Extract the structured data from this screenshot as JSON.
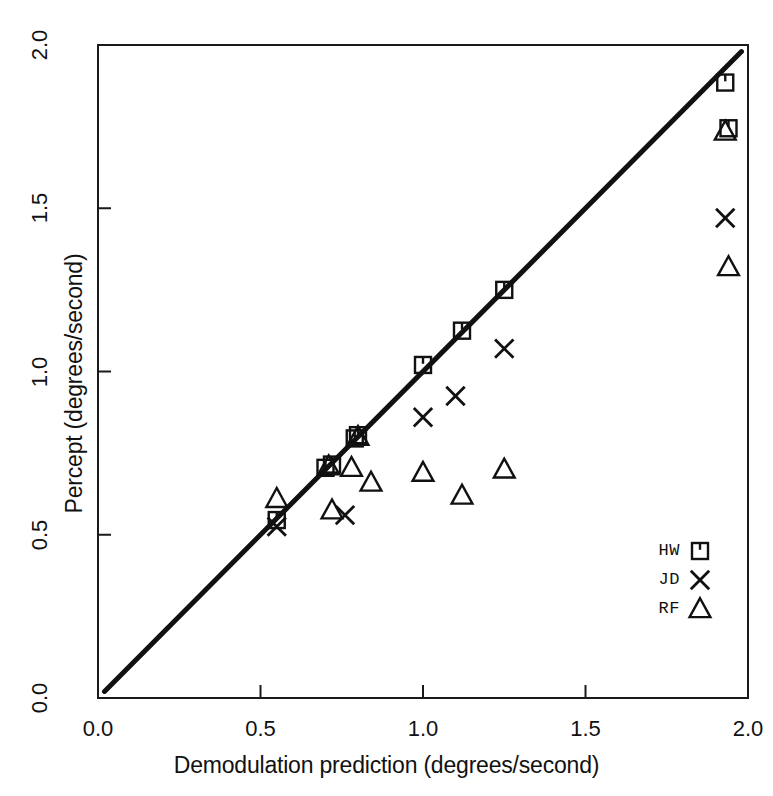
{
  "chart_data": {
    "type": "scatter",
    "title": "",
    "xlabel": "Demodulation prediction (degrees/second)",
    "ylabel": "Percept (degrees/second)",
    "xlim": [
      0.0,
      2.0
    ],
    "ylim": [
      0.0,
      2.0
    ],
    "xticks": [
      "0.0",
      "0.5",
      "1.0",
      "1.5",
      "2.0"
    ],
    "yticks": [
      "0.0",
      "0.5",
      "1.0",
      "1.5",
      "2.0"
    ],
    "xtick_values": [
      0.0,
      0.5,
      1.0,
      1.5,
      2.0
    ],
    "ytick_values": [
      0.0,
      0.5,
      1.0,
      1.5,
      2.0
    ],
    "grid": false,
    "legend_position": "bottom-right",
    "reference_line": {
      "name": "identity-line",
      "from": [
        0.02,
        0.02
      ],
      "to": [
        1.98,
        1.98
      ]
    },
    "series": [
      {
        "name": "HW",
        "marker": "square",
        "points": [
          [
            0.55,
            0.545
          ],
          [
            0.7,
            0.705
          ],
          [
            0.72,
            0.715
          ],
          [
            0.79,
            0.795
          ],
          [
            0.8,
            0.805
          ],
          [
            1.0,
            1.02
          ],
          [
            1.12,
            1.125
          ],
          [
            1.25,
            1.25
          ],
          [
            1.93,
            1.885
          ],
          [
            1.94,
            1.745
          ]
        ]
      },
      {
        "name": "JD",
        "marker": "cross",
        "points": [
          [
            0.55,
            0.525
          ],
          [
            0.76,
            0.56
          ],
          [
            1.0,
            0.86
          ],
          [
            1.1,
            0.925
          ],
          [
            1.25,
            1.07
          ],
          [
            1.93,
            1.47
          ]
        ]
      },
      {
        "name": "RF",
        "marker": "triangle",
        "points": [
          [
            0.55,
            0.61
          ],
          [
            0.72,
            0.575
          ],
          [
            0.71,
            0.71
          ],
          [
            0.78,
            0.705
          ],
          [
            0.8,
            0.8
          ],
          [
            0.84,
            0.66
          ],
          [
            1.0,
            0.69
          ],
          [
            1.12,
            0.62
          ],
          [
            1.25,
            0.7
          ],
          [
            1.93,
            1.735
          ],
          [
            1.94,
            1.32
          ]
        ]
      }
    ],
    "legend": [
      {
        "label": "HW",
        "marker": "square"
      },
      {
        "label": "JD",
        "marker": "cross"
      },
      {
        "label": "RF",
        "marker": "triangle"
      }
    ]
  }
}
